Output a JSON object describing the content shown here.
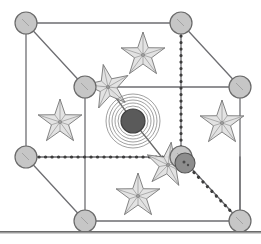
{
  "figure": {
    "caption": "",
    "width": 261,
    "height": 244,
    "background": "#ffffff"
  },
  "colors": {
    "cube_edge": "#6e6e72",
    "corner_atom_fill": "#c6c6c6",
    "corner_atom_stroke": "#6a6a6a",
    "center_atom_fill": "#5a5a5a",
    "center_atom_stroke": "#3f3f3f",
    "ring_stroke": "#7a7a7a",
    "interior_atom_fill": "#8d8d8d",
    "interior_atom_stroke": "#555555",
    "star_fill": "#e2e2e2",
    "star_stroke": "#6f6f6f",
    "hidden_edge": "#3d3d3d",
    "rule": "#6b6b6b"
  },
  "geometry": {
    "back_face": {
      "top_left": [
        26,
        23
      ],
      "top_right": [
        181,
        23
      ],
      "bottom_left": [
        26,
        157
      ],
      "bottom_right": [
        181,
        157
      ]
    },
    "front_face": {
      "top_left": [
        85,
        87
      ],
      "top_right": [
        240,
        87
      ],
      "bottom_left": [
        85,
        221
      ],
      "bottom_right": [
        240,
        221
      ]
    }
  },
  "atoms": {
    "corner_label": "corner atom",
    "center_label": "body-centre atom",
    "interior_label": "interior atom",
    "radius_corner": 11,
    "radius_center": 12,
    "radius_interior": 10,
    "corner_positions": [
      [
        26,
        23
      ],
      [
        181,
        23
      ],
      [
        26,
        157
      ],
      [
        181,
        157
      ],
      [
        85,
        87
      ],
      [
        240,
        87
      ],
      [
        85,
        221
      ],
      [
        240,
        221
      ]
    ],
    "center_position": [
      133,
      121
    ],
    "interior_position": [
      185,
      163
    ],
    "ring_count": 5,
    "ring_radii": [
      15,
      18,
      21,
      24,
      27
    ]
  },
  "stars": {
    "label": "interstitial site",
    "points": 5,
    "outer_radius": 23,
    "inner_radius": 9,
    "positions": [
      {
        "x": 143,
        "y": 55,
        "rot": 0
      },
      {
        "x": 108,
        "y": 87,
        "rot": -12
      },
      {
        "x": 60,
        "y": 122,
        "rot": 0
      },
      {
        "x": 222,
        "y": 123,
        "rot": 0
      },
      {
        "x": 168,
        "y": 165,
        "rot": 8
      },
      {
        "x": 138,
        "y": 196,
        "rot": 0
      }
    ]
  },
  "edges": {
    "solid_label": "visible cube edge",
    "hidden_label": "hidden cube edge (dotted)",
    "solid": [
      [
        26,
        23,
        181,
        23
      ],
      [
        26,
        23,
        26,
        157
      ],
      [
        181,
        23,
        181,
        157
      ],
      [
        26,
        23,
        85,
        87
      ],
      [
        181,
        23,
        240,
        87
      ],
      [
        85,
        87,
        240,
        87
      ],
      [
        85,
        87,
        85,
        221
      ],
      [
        240,
        87,
        240,
        221
      ],
      [
        85,
        221,
        240,
        221
      ],
      [
        26,
        157,
        85,
        221
      ],
      [
        240,
        157,
        240,
        221
      ],
      [
        26,
        157,
        181,
        157
      ],
      [
        181,
        157,
        240,
        221
      ]
    ],
    "hidden": [
      [
        181,
        23,
        181,
        157
      ],
      [
        26,
        157,
        181,
        157
      ],
      [
        185,
        163,
        240,
        221
      ]
    ]
  },
  "bonds": {
    "label": "bond to body-centre atom",
    "lines": [
      [
        108,
        87,
        133,
        121
      ],
      [
        133,
        121,
        168,
        165
      ]
    ]
  },
  "rule": {
    "label": "horizontal divider",
    "y": 231
  }
}
